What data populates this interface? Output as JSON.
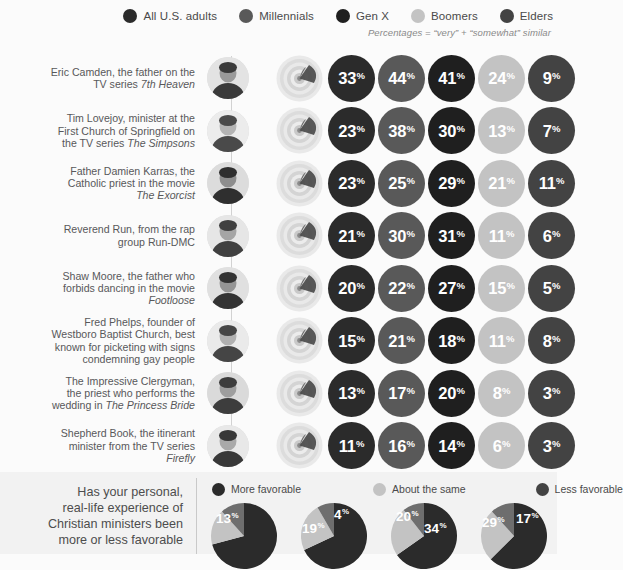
{
  "legend": {
    "items": [
      {
        "label": "All U.S. adults",
        "color": "#2b2b2b"
      },
      {
        "label": "Millennials",
        "color": "#595959"
      },
      {
        "label": "Gen X",
        "color": "#1f1f1f"
      },
      {
        "label": "Boomers",
        "color": "#c3c3c3"
      },
      {
        "label": "Elders",
        "color": "#434343"
      }
    ],
    "note": "Percentages = “very” + “somewhat” similar"
  },
  "chart_data": {
    "type": "bar",
    "title": "Percentages = “very” + “somewhat” similar",
    "xlabel": "",
    "ylabel": "",
    "categories": [
      "Eric Camden, the father on the TV series 7th Heaven",
      "Tim Lovejoy, minister at the First Church of Springfield on the TV series The Simpsons",
      "Father Damien Karras, the Catholic priest in the movie The Exorcist",
      "Reverend Run, from the rap group Run-DMC",
      "Shaw Moore, the father who forbids dancing in the movie Footloose",
      "Fred Phelps, founder of Westboro Baptist Church, best known for picketing with signs condemning gay people",
      "The Impressive Clergyman, the priest who performs the wedding in The Princess Bride",
      "Shepherd Book, the itinerant minister from the TV series Firefly"
    ],
    "series": [
      {
        "name": "All U.S. adults",
        "color": "#2b2b2b",
        "values": [
          33,
          23,
          23,
          21,
          20,
          15,
          13,
          11
        ]
      },
      {
        "name": "Millennials",
        "color": "#595959",
        "values": [
          44,
          38,
          25,
          30,
          22,
          21,
          17,
          16
        ]
      },
      {
        "name": "Gen X",
        "color": "#1f1f1f",
        "values": [
          41,
          30,
          29,
          31,
          27,
          18,
          20,
          14
        ]
      },
      {
        "name": "Boomers",
        "color": "#c3c3c3",
        "values": [
          24,
          13,
          21,
          11,
          15,
          11,
          8,
          6
        ]
      },
      {
        "name": "Elders",
        "color": "#434343",
        "values": [
          9,
          7,
          11,
          6,
          5,
          8,
          3,
          3
        ]
      }
    ],
    "unit": "%"
  },
  "rows": [
    {
      "label_lines": [
        {
          "text": "Eric Camden, the father on the",
          "italic": false
        },
        {
          "text": "TV series ",
          "italic": false,
          "tail": "7th Heaven",
          "tail_italic": true
        }
      ],
      "portrait": "portrait-eric-camden",
      "values": [
        33,
        44,
        41,
        24,
        9
      ]
    },
    {
      "label_lines": [
        {
          "text": "Tim Lovejoy, minister at the",
          "italic": false
        },
        {
          "text": "First Church of Springfield on",
          "italic": false
        },
        {
          "text": "the TV series ",
          "italic": false,
          "tail": "The Simpsons",
          "tail_italic": true
        }
      ],
      "portrait": "portrait-tim-lovejoy",
      "values": [
        23,
        38,
        30,
        13,
        7
      ]
    },
    {
      "label_lines": [
        {
          "text": "Father Damien Karras, the",
          "italic": false
        },
        {
          "text": "Catholic priest in the movie",
          "italic": false
        },
        {
          "text": "",
          "italic": false,
          "tail": "The Exorcist",
          "tail_italic": true
        }
      ],
      "portrait": "portrait-damien-karras",
      "values": [
        23,
        25,
        29,
        21,
        11
      ]
    },
    {
      "label_lines": [
        {
          "text": "Reverend Run, from the rap",
          "italic": false
        },
        {
          "text": "group Run-DMC",
          "italic": false
        }
      ],
      "portrait": "portrait-reverend-run",
      "values": [
        21,
        30,
        31,
        11,
        6
      ]
    },
    {
      "label_lines": [
        {
          "text": "Shaw Moore, the father who",
          "italic": false
        },
        {
          "text": "forbids dancing in the movie",
          "italic": false
        },
        {
          "text": "",
          "italic": false,
          "tail": "Footloose",
          "tail_italic": true
        }
      ],
      "portrait": "portrait-shaw-moore",
      "values": [
        20,
        22,
        27,
        15,
        5
      ]
    },
    {
      "label_lines": [
        {
          "text": "Fred Phelps, founder of",
          "italic": false
        },
        {
          "text": "Westboro Baptist Church, best",
          "italic": false
        },
        {
          "text": "known for picketing with signs",
          "italic": false
        },
        {
          "text": "condemning gay people",
          "italic": false
        }
      ],
      "portrait": "portrait-fred-phelps",
      "values": [
        15,
        21,
        18,
        11,
        8
      ]
    },
    {
      "label_lines": [
        {
          "text": "The Impressive Clergyman,",
          "italic": false
        },
        {
          "text": "the priest who performs the",
          "italic": false
        },
        {
          "text": "wedding in ",
          "italic": false,
          "tail": "The Princess Bride",
          "tail_italic": true
        }
      ],
      "portrait": "portrait-impressive-clergyman",
      "values": [
        13,
        17,
        20,
        8,
        3
      ]
    },
    {
      "label_lines": [
        {
          "text": "Shepherd Book, the itinerant",
          "italic": false
        },
        {
          "text": "minister from the TV series",
          "italic": false
        },
        {
          "text": "",
          "italic": false,
          "tail": "Firefly",
          "tail_italic": true
        }
      ],
      "portrait": "portrait-shepherd-book",
      "values": [
        11,
        16,
        14,
        6,
        3
      ]
    }
  ],
  "bottom": {
    "question_lines": [
      "Has your personal,",
      "real-life experience of",
      "Christian ministers been",
      "more or less favorable"
    ],
    "legend": [
      {
        "label": "More favorable",
        "color": "#2b2b2b"
      },
      {
        "label": "About the same",
        "color": "#c3c3c3"
      },
      {
        "label": "Less favorable",
        "color": "#434343"
      }
    ],
    "pies": [
      {
        "name": "pie-1",
        "labels": [
          {
            "value": 13,
            "unit": "%"
          }
        ]
      },
      {
        "name": "pie-2",
        "labels": [
          {
            "value": 19,
            "unit": "%"
          },
          {
            "value": 4,
            "unit": "%"
          }
        ]
      },
      {
        "name": "pie-3",
        "labels": [
          {
            "value": 20,
            "unit": "%"
          },
          {
            "value": 34,
            "unit": "%"
          }
        ]
      },
      {
        "name": "pie-4",
        "labels": [
          {
            "value": 29,
            "unit": "%"
          },
          {
            "value": 17,
            "unit": "%"
          }
        ]
      }
    ]
  }
}
